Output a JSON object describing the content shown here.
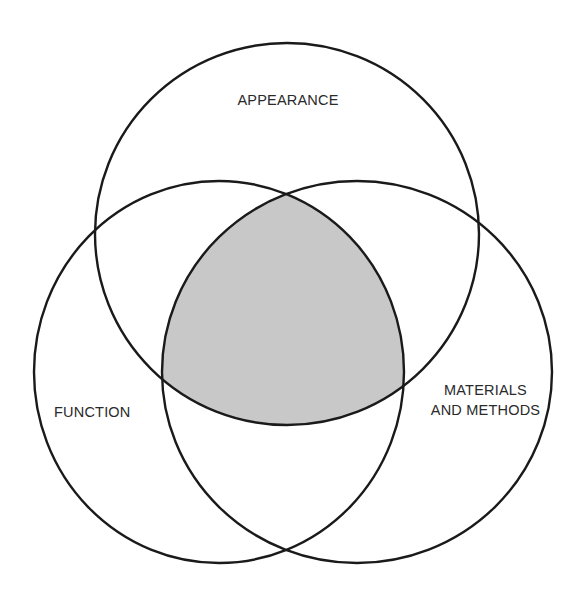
{
  "diagram": {
    "type": "venn",
    "sets": [
      {
        "id": "appearance",
        "label": "APPEARANCE",
        "position": "top"
      },
      {
        "id": "function",
        "label": "FUNCTION",
        "position": "bottom-left"
      },
      {
        "id": "materials",
        "label_line1": "MATERIALS",
        "label_line2": "AND METHODS",
        "position": "bottom-right"
      }
    ],
    "highlighted_region": "intersection of all three sets",
    "colors": {
      "stroke": "#1a1a1a",
      "highlight_fill": "#c8c8c8",
      "background": "#ffffff"
    }
  }
}
